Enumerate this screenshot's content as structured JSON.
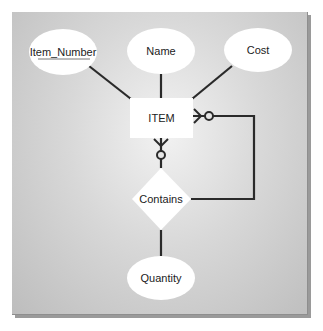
{
  "diagram": {
    "type": "entity-relationship",
    "entity": {
      "label": "ITEM"
    },
    "relationship": {
      "label": "Contains"
    },
    "attributes": [
      {
        "label": "Item_Number",
        "is_key": true,
        "attached_to": "ITEM"
      },
      {
        "label": "Name",
        "is_key": false,
        "attached_to": "ITEM"
      },
      {
        "label": "Cost",
        "is_key": false,
        "attached_to": "ITEM"
      },
      {
        "label": "Quantity",
        "is_key": false,
        "attached_to": "Contains"
      }
    ],
    "connections": [
      {
        "from": "ITEM",
        "to": "Contains",
        "side": "bottom",
        "cardinality": "zero-or-many"
      },
      {
        "from": "ITEM",
        "to": "Contains",
        "side": "right-loop",
        "cardinality": "zero-or-many"
      }
    ],
    "colors": {
      "line": "#2a2a2a",
      "shape_fill": "#ffffff",
      "background": "#d6d6d6"
    }
  }
}
